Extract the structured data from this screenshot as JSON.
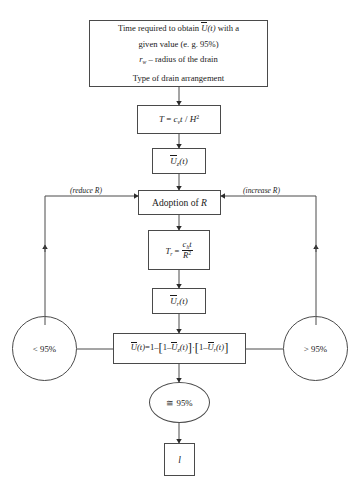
{
  "diagram": {
    "type": "flowchart",
    "line_color": "#4a4a4a",
    "text_color": "#1a1a1a",
    "background": "#ffffff",
    "nodes": {
      "start": {
        "shape": "rectangle",
        "line1_a": "Time required to obtain",
        "line1_var": "U",
        "line1_varsub": "",
        "line1_arg": "(t)",
        "line1_b": "with a",
        "line2": "given value (e. g. 95%)",
        "line3_var": "r",
        "line3_sub": "w",
        "line3_rest": "– radius of the drain",
        "line4": "Type of drain arrangement"
      },
      "time_factor": {
        "shape": "rectangle",
        "lhs": "T",
        "eq": "=",
        "num_c": "c",
        "num_sub": "v",
        "num_t": "t",
        "slash": "/",
        "den_h": "H",
        "den_pow": "2"
      },
      "uz": {
        "shape": "rectangle",
        "var": "U",
        "sub": "z",
        "arg": "(t)"
      },
      "adoption": {
        "shape": "rectangle",
        "label": "Adoption of",
        "var": "R"
      },
      "tr": {
        "shape": "rectangle",
        "lhs": "T",
        "lhs_sub": "r",
        "eq": "=",
        "num_c": "c",
        "num_sub": "h",
        "num_t": "t",
        "den_r": "R",
        "den_pow": "2"
      },
      "ur": {
        "shape": "rectangle",
        "var": "U",
        "sub": "r",
        "arg": "(t)"
      },
      "combined": {
        "shape": "rectangle",
        "lhs_var": "U",
        "lhs_arg": "(t)",
        "eq": "=",
        "one": "1",
        "minus": "–",
        "open1": "[",
        "one_b": "1",
        "minus_b": "–",
        "uz_var": "U",
        "uz_sub": "z",
        "uz_arg": "(t)",
        "close1": "]",
        "dot": "·",
        "open2": "[",
        "one_c": "1",
        "minus_c": "–",
        "ur_var": "U",
        "ur_sub": "r",
        "ur_arg": "(t)",
        "close2": "]"
      },
      "less": {
        "shape": "circle",
        "label": "< 95%"
      },
      "greater": {
        "shape": "circle",
        "label": "> 95%"
      },
      "approx": {
        "shape": "circle",
        "label": "≅ 95%"
      },
      "result": {
        "shape": "rectangle",
        "label": "l"
      }
    },
    "edge_labels": {
      "reduce": "(reduce R)",
      "increase": "(increase R)"
    }
  }
}
